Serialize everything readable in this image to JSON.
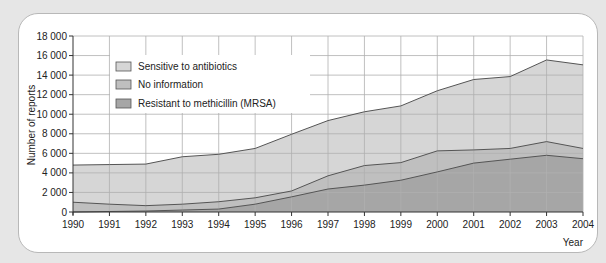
{
  "chart_data": {
    "type": "area",
    "stacked": false,
    "title": "",
    "xlabel": "Year",
    "ylabel": "Number of reports",
    "x": [
      1990,
      1991,
      1992,
      1993,
      1994,
      1995,
      1996,
      1997,
      1998,
      1999,
      2000,
      2001,
      2002,
      2003,
      2004
    ],
    "xlim": [
      1990,
      2004
    ],
    "ylim": [
      0,
      18000
    ],
    "yticks": [
      0,
      2000,
      4000,
      6000,
      8000,
      10000,
      12000,
      14000,
      16000,
      18000
    ],
    "ytick_labels": [
      "0",
      "2 000",
      "4 000",
      "6 000",
      "8 000",
      "10 000",
      "12 000",
      "14 000",
      "16 000",
      "18 000"
    ],
    "xtick_labels": [
      "1990",
      "1991",
      "1992",
      "1993",
      "1994",
      "1995",
      "1996",
      "1997",
      "1998",
      "1999",
      "2000",
      "2001",
      "2002",
      "2003",
      "2004"
    ],
    "grid": true,
    "legend_position": "upper-left-inside",
    "series_note": "Cumulative boundaries: each value is the upper edge of the band (total for top series).",
    "series": [
      {
        "name": "Sensitive to antibiotics",
        "color": "#d6d6d6",
        "values": [
          4800,
          4850,
          4900,
          5650,
          5900,
          6500,
          7950,
          9350,
          10250,
          10850,
          12400,
          13550,
          13850,
          15550,
          15050
        ]
      },
      {
        "name": "No information",
        "color": "#bfbfbf",
        "values": [
          1000,
          800,
          650,
          800,
          1050,
          1450,
          2150,
          3700,
          4750,
          5050,
          6250,
          6350,
          6500,
          7200,
          6500
        ]
      },
      {
        "name": "Resistant to methicillin (MRSA)",
        "color": "#a6a6a6",
        "values": [
          0,
          50,
          100,
          200,
          300,
          800,
          1550,
          2350,
          2750,
          3250,
          4100,
          5000,
          5400,
          5800,
          5450
        ]
      }
    ]
  },
  "colors": {
    "page_background": "#e6e6e6",
    "card_background": "#ffffff",
    "line": "#555555",
    "grid": "#b0b0b0"
  }
}
